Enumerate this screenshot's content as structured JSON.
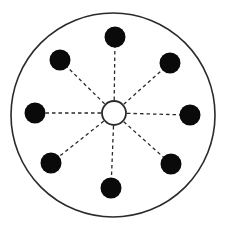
{
  "diagram": {
    "colors": {
      "background": "#ffffff",
      "outline": "#2a2a2a",
      "node_fill": "#0a0a0a",
      "center_fill": "#ffffff",
      "spoke": "#2a2a2a"
    },
    "outer_circle": {
      "cx": 113,
      "cy": 115,
      "r": 102,
      "stroke_width": 1.6
    },
    "center_node": {
      "cx": 114,
      "cy": 113,
      "r": 12,
      "stroke_width": 1.8
    },
    "spoke_style": {
      "dash": "3.5 3",
      "stroke_width": 1.3
    },
    "node_radius": 10.5,
    "nodes": [
      {
        "id": "top",
        "cx": 115,
        "cy": 37
      },
      {
        "id": "upper-right",
        "cx": 170,
        "cy": 63
      },
      {
        "id": "right",
        "cx": 190,
        "cy": 115
      },
      {
        "id": "lower-right",
        "cx": 171,
        "cy": 164
      },
      {
        "id": "bottom",
        "cx": 111,
        "cy": 188
      },
      {
        "id": "lower-left",
        "cx": 51,
        "cy": 163
      },
      {
        "id": "left",
        "cx": 35,
        "cy": 113
      },
      {
        "id": "upper-left",
        "cx": 60,
        "cy": 60
      }
    ]
  }
}
